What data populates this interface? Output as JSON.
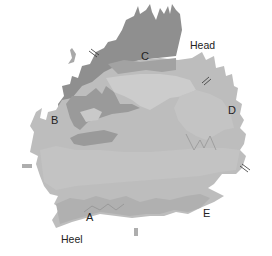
{
  "diagram": {
    "labels": {
      "head": "Head",
      "heel": "Heel",
      "A": "A",
      "B": "B",
      "C": "C",
      "D": "D",
      "E": "E"
    },
    "colors": {
      "outer_dark": "#8f8f8f",
      "mid": "#b3b3b3",
      "light": "#c6c6c6",
      "lighter": "#cfcfcf",
      "background": "#ffffff",
      "text": "#222222"
    },
    "break_marks": [
      "top-left",
      "top-right",
      "left",
      "right",
      "bottom"
    ]
  }
}
